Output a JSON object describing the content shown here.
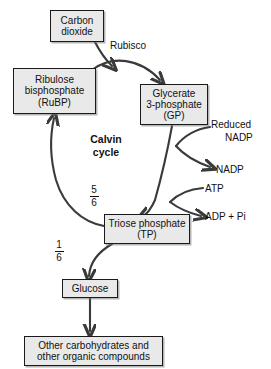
{
  "diagram": {
    "title": "Calvin cycle",
    "center_label": {
      "line1": "Calvin",
      "line2": "cycle"
    },
    "colors": {
      "box_fill": "#e9e9e9",
      "box_border": "#1a1a1a",
      "arrow": "#3a3a3a",
      "text": "#111111",
      "background": "#ffffff"
    },
    "boxes": {
      "carbon_dioxide": {
        "line1": "Carbon",
        "line2": "dioxide"
      },
      "rubp": {
        "line1": "Ribulose",
        "line2": "bisphosphate",
        "line3": "(RuBP)"
      },
      "gp": {
        "line1": "Glycerate",
        "line2": "3-phosphate",
        "line3": "(GP)"
      },
      "triose_phosphate": {
        "line1": "Triose phosphate",
        "line2": "(TP)"
      },
      "glucose": {
        "line1": "Glucose"
      },
      "other_products": {
        "line1": "Other carbohydrates and",
        "line2": "other organic compounds"
      }
    },
    "labels": {
      "rubisco": "Rubisco",
      "reduced_nadp_line1": "Reduced",
      "reduced_nadp_line2": "NADP",
      "nadp": "NADP",
      "atp": "ATP",
      "adp_pi": "ADP + Pi"
    },
    "fractions": {
      "to_rubp": {
        "numerator": "5",
        "denominator": "6"
      },
      "to_glucose": {
        "numerator": "1",
        "denominator": "6"
      }
    }
  }
}
